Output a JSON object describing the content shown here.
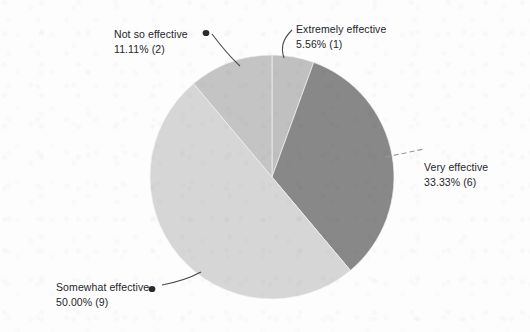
{
  "chart_data": {
    "type": "pie",
    "title": "",
    "subtitle": "",
    "xlabel": "",
    "ylabel": "",
    "total_responses": 18,
    "legend_position": "none",
    "grid": false,
    "labels_outside": true,
    "categories": [
      "Extremely effective",
      "Very effective",
      "Somewhat effective",
      "Not so effective"
    ],
    "values": [
      1,
      6,
      9,
      2
    ],
    "percentages": [
      5.56,
      33.33,
      50.0,
      11.11
    ],
    "slices": [
      {
        "label": "Extremely effective",
        "percent_text": "5.56% (1)",
        "percent": 5.56,
        "count": 1,
        "color": "#c0c0c0",
        "start_angle": 0.0,
        "end_angle": 20.0
      },
      {
        "label": "Very effective",
        "percent_text": "33.33% (6)",
        "percent": 33.33,
        "count": 6,
        "color": "#888888",
        "start_angle": 20.0,
        "end_angle": 140.0
      },
      {
        "label": "Somewhat effective",
        "percent_text": "50.00% (9)",
        "percent": 50.0,
        "count": 9,
        "color": "#d6d6d6",
        "start_angle": 140.0,
        "end_angle": 320.0
      },
      {
        "label": "Not so effective",
        "percent_text": "11.11% (2)",
        "percent": 11.11,
        "count": 2,
        "color": "#c4c4c4",
        "start_angle": 320.0,
        "end_angle": 360.0
      }
    ]
  },
  "labels": {
    "extremely_effective": {
      "name": "Extremely effective",
      "value": "5.56% (1)"
    },
    "not_so_effective": {
      "name": "Not so effective",
      "value": "11.11% (2)"
    },
    "very_effective": {
      "name": "Very effective",
      "value": "33.33% (6)"
    },
    "somewhat_effective": {
      "name": "Somewhat effective",
      "value": "50.00% (9)"
    }
  },
  "colors": {
    "background": "#fdfdfd",
    "text": "#24262b",
    "leader_line": "#4a4a4a",
    "slice_extremely_effective": "#c0c0c0",
    "slice_very_effective": "#888888",
    "slice_somewhat_effective": "#d6d6d6",
    "slice_not_so_effective": "#c4c4c4"
  }
}
